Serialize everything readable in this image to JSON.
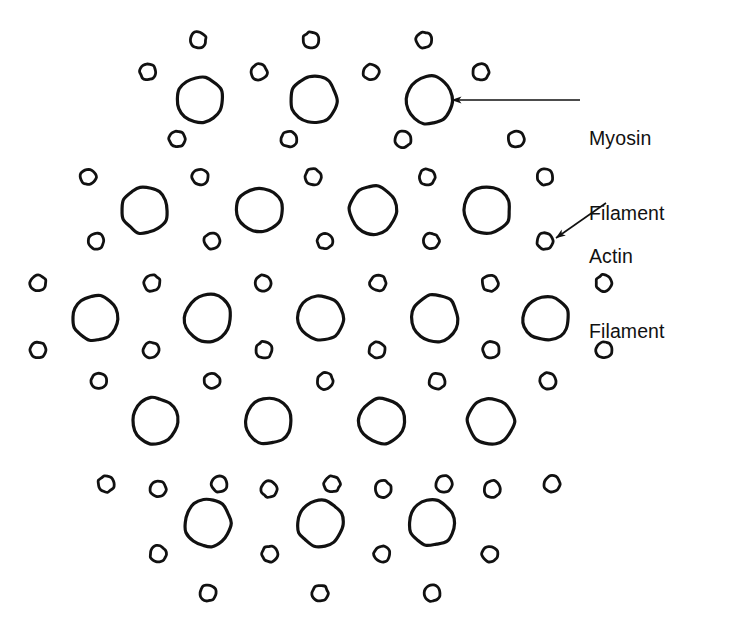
{
  "diagram": {
    "background_color": "#ffffff",
    "stroke_color": "#111111",
    "canvas": {
      "width": 744,
      "height": 631
    },
    "annotations": [
      {
        "id": "myosin",
        "label_line1": "Myosin",
        "label_line2": "Filament",
        "label_x": 589,
        "label_y": 76,
        "arrow": {
          "x1": 580,
          "y1": 100,
          "x2": 452,
          "y2": 100
        },
        "points_to": {
          "x": 430,
          "y": 100,
          "kind": "myosin"
        }
      },
      {
        "id": "actin",
        "label_line1": "Actin",
        "label_line2": "Filament",
        "label_x": 589,
        "label_y": 194,
        "arrow": {
          "x1": 606,
          "y1": 203,
          "x2": 556,
          "y2": 238
        },
        "points_to": {
          "x": 545,
          "y": 241,
          "kind": "actin"
        }
      }
    ],
    "legend": {
      "myosin_name": "Myosin Filament",
      "actin_name": "Actin Filament"
    },
    "counts": {
      "myosin_filaments": 19,
      "actin_filaments": 44
    },
    "myosin_radius": 23,
    "actin_radius": 8,
    "stroke_width_myosin": 3.2,
    "stroke_width_actin": 2.8,
    "myosin_filaments": [
      {
        "cx": 200,
        "cy": 100
      },
      {
        "cx": 314,
        "cy": 100
      },
      {
        "cx": 430,
        "cy": 100
      },
      {
        "cx": 145,
        "cy": 210
      },
      {
        "cx": 259,
        "cy": 210
      },
      {
        "cx": 373,
        "cy": 210
      },
      {
        "cx": 487,
        "cy": 210
      },
      {
        "cx": 95,
        "cy": 318
      },
      {
        "cx": 208,
        "cy": 318
      },
      {
        "cx": 321,
        "cy": 318
      },
      {
        "cx": 435,
        "cy": 318
      },
      {
        "cx": 546,
        "cy": 318
      },
      {
        "cx": 155,
        "cy": 421
      },
      {
        "cx": 268,
        "cy": 421
      },
      {
        "cx": 382,
        "cy": 421
      },
      {
        "cx": 491,
        "cy": 421
      },
      {
        "cx": 208,
        "cy": 523
      },
      {
        "cx": 320,
        "cy": 523
      },
      {
        "cx": 432,
        "cy": 523
      }
    ],
    "actin_filaments": [
      {
        "cx": 198,
        "cy": 40
      },
      {
        "cx": 311,
        "cy": 40
      },
      {
        "cx": 424,
        "cy": 40
      },
      {
        "cx": 148,
        "cy": 72
      },
      {
        "cx": 259,
        "cy": 72
      },
      {
        "cx": 371,
        "cy": 72
      },
      {
        "cx": 481,
        "cy": 72
      },
      {
        "cx": 177,
        "cy": 139
      },
      {
        "cx": 289,
        "cy": 139
      },
      {
        "cx": 403,
        "cy": 139
      },
      {
        "cx": 516,
        "cy": 139
      },
      {
        "cx": 88,
        "cy": 177
      },
      {
        "cx": 200,
        "cy": 177
      },
      {
        "cx": 313,
        "cy": 177
      },
      {
        "cx": 427,
        "cy": 177
      },
      {
        "cx": 545,
        "cy": 177
      },
      {
        "cx": 96,
        "cy": 241
      },
      {
        "cx": 212,
        "cy": 241
      },
      {
        "cx": 325,
        "cy": 241
      },
      {
        "cx": 431,
        "cy": 241
      },
      {
        "cx": 545,
        "cy": 241
      },
      {
        "cx": 38,
        "cy": 283
      },
      {
        "cx": 152,
        "cy": 283
      },
      {
        "cx": 263,
        "cy": 283
      },
      {
        "cx": 378,
        "cy": 283
      },
      {
        "cx": 490,
        "cy": 283
      },
      {
        "cx": 604,
        "cy": 283
      },
      {
        "cx": 38,
        "cy": 350
      },
      {
        "cx": 151,
        "cy": 350
      },
      {
        "cx": 264,
        "cy": 350
      },
      {
        "cx": 377,
        "cy": 350
      },
      {
        "cx": 491,
        "cy": 350
      },
      {
        "cx": 604,
        "cy": 350
      },
      {
        "cx": 99,
        "cy": 381
      },
      {
        "cx": 212,
        "cy": 381
      },
      {
        "cx": 325,
        "cy": 381
      },
      {
        "cx": 437,
        "cy": 381
      },
      {
        "cx": 548,
        "cy": 381
      },
      {
        "cx": 106,
        "cy": 484
      },
      {
        "cx": 219,
        "cy": 484
      },
      {
        "cx": 332,
        "cy": 484
      },
      {
        "cx": 444,
        "cy": 484
      },
      {
        "cx": 552,
        "cy": 484
      },
      {
        "cx": 158,
        "cy": 489
      },
      {
        "cx": 269,
        "cy": 489
      },
      {
        "cx": 383,
        "cy": 489
      },
      {
        "cx": 492,
        "cy": 489
      },
      {
        "cx": 158,
        "cy": 554
      },
      {
        "cx": 270,
        "cy": 554
      },
      {
        "cx": 382,
        "cy": 554
      },
      {
        "cx": 490,
        "cy": 554
      },
      {
        "cx": 208,
        "cy": 593
      },
      {
        "cx": 320,
        "cy": 593
      },
      {
        "cx": 432,
        "cy": 593
      }
    ]
  }
}
